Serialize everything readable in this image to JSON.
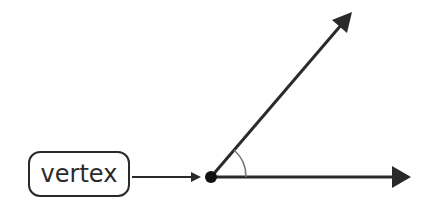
{
  "diagram": {
    "type": "angle-diagram",
    "label": "vertex",
    "colors": {
      "stroke": "#2a2a2a",
      "arc": "#777777",
      "background": "#ffffff"
    },
    "vertex_point": {
      "x": 211,
      "y": 177
    },
    "rays": [
      {
        "name": "inclined-ray",
        "end": {
          "x": 352,
          "y": 12
        }
      },
      {
        "name": "horizontal-ray",
        "end": {
          "x": 411,
          "y": 177
        }
      }
    ],
    "pointer_arrow": {
      "from": {
        "x": 132,
        "y": 177
      },
      "to": {
        "x": 204,
        "y": 177
      }
    }
  }
}
